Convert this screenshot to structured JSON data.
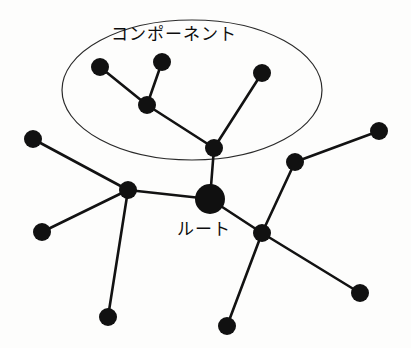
{
  "figure": {
    "title_visible": false,
    "background_color": "#fdfdfc",
    "ink_color": "#111111",
    "width": 411,
    "height": 348
  },
  "labels": {
    "component": "コンポーネント",
    "root": "ルート"
  },
  "group_region": {
    "name": "component-ellipse",
    "shape": "ellipse",
    "cx": 192,
    "cy": 90,
    "rx": 130,
    "ry": 70,
    "stroke": "#2a2a2a"
  },
  "graph": {
    "type": "node-link-tree",
    "node_radius_default": 9,
    "node_radius_root": 15,
    "nodes": [
      {
        "id": "n1",
        "name": "component-leaf-upper-left",
        "x": 100,
        "y": 67,
        "r": 9,
        "in_component": true
      },
      {
        "id": "n2",
        "name": "component-leaf-upper-mid",
        "x": 162,
        "y": 62,
        "r": 9,
        "in_component": true
      },
      {
        "id": "n3",
        "name": "component-branch",
        "x": 147,
        "y": 105,
        "r": 9,
        "in_component": true
      },
      {
        "id": "n4",
        "name": "component-leaf-upper-right",
        "x": 262,
        "y": 73,
        "r": 9,
        "in_component": true
      },
      {
        "id": "n5",
        "name": "component-anchor",
        "x": 214,
        "y": 148,
        "r": 9,
        "in_component": true
      },
      {
        "id": "root",
        "name": "root-node",
        "x": 210,
        "y": 199,
        "r": 15,
        "in_component": false
      },
      {
        "id": "n6",
        "name": "left-hub",
        "x": 128,
        "y": 190,
        "r": 9,
        "in_component": false
      },
      {
        "id": "n7",
        "name": "left-leaf-upper",
        "x": 33,
        "y": 139,
        "r": 9,
        "in_component": false
      },
      {
        "id": "n8",
        "name": "left-leaf-lower",
        "x": 42,
        "y": 232,
        "r": 9,
        "in_component": false
      },
      {
        "id": "n9",
        "name": "left-leaf-bottom",
        "x": 108,
        "y": 317,
        "r": 9,
        "in_component": false
      },
      {
        "id": "n10",
        "name": "right-hub",
        "x": 262,
        "y": 233,
        "r": 9,
        "in_component": false
      },
      {
        "id": "n11",
        "name": "right-upper-hub",
        "x": 295,
        "y": 162,
        "r": 9,
        "in_component": false
      },
      {
        "id": "n12",
        "name": "right-leaf-top",
        "x": 379,
        "y": 131,
        "r": 9,
        "in_component": false
      },
      {
        "id": "n13",
        "name": "right-leaf-bottom",
        "x": 360,
        "y": 293,
        "r": 9,
        "in_component": false
      },
      {
        "id": "n14",
        "name": "bottom-leaf-center",
        "x": 227,
        "y": 326,
        "r": 9,
        "in_component": false
      }
    ],
    "edges": [
      {
        "name": "edge-n1-n3",
        "from": "n1",
        "to": "n3"
      },
      {
        "name": "edge-n2-n3",
        "from": "n2",
        "to": "n3"
      },
      {
        "name": "edge-n3-n5",
        "from": "n3",
        "to": "n5"
      },
      {
        "name": "edge-n4-n5",
        "from": "n4",
        "to": "n5"
      },
      {
        "name": "edge-n5-root",
        "from": "n5",
        "to": "root"
      },
      {
        "name": "edge-root-n6",
        "from": "root",
        "to": "n6"
      },
      {
        "name": "edge-root-n10",
        "from": "root",
        "to": "n10"
      },
      {
        "name": "edge-n6-n7",
        "from": "n6",
        "to": "n7"
      },
      {
        "name": "edge-n6-n8",
        "from": "n6",
        "to": "n8"
      },
      {
        "name": "edge-n6-n9",
        "from": "n6",
        "to": "n9"
      },
      {
        "name": "edge-n10-n11",
        "from": "n10",
        "to": "n11"
      },
      {
        "name": "edge-n10-n13",
        "from": "n10",
        "to": "n13"
      },
      {
        "name": "edge-n10-n14",
        "from": "n10",
        "to": "n14"
      },
      {
        "name": "edge-n11-n12",
        "from": "n11",
        "to": "n12"
      }
    ]
  }
}
